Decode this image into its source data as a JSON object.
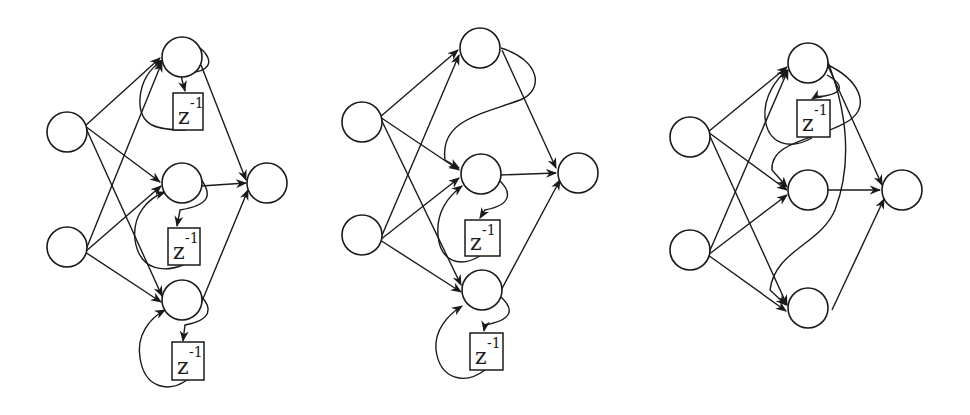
{
  "figure": {
    "node_radius": 20,
    "stroke_color": "#1a1a1a",
    "background": "#ffffff"
  },
  "delay_label": {
    "base": "z",
    "exponent": "-1"
  },
  "diagrams": [
    {
      "id": "diagram-1",
      "nodes": {
        "input1": [
          67,
          132
        ],
        "input2": [
          67,
          247
        ],
        "hidden1": [
          182,
          57
        ],
        "hidden2": [
          182,
          183
        ],
        "hidden3": [
          182,
          300
        ],
        "output": [
          267,
          183
        ]
      },
      "delays": [
        {
          "x": 173,
          "y": 93,
          "w": 30,
          "h": 37
        },
        {
          "x": 168,
          "y": 228,
          "w": 32,
          "h": 37
        },
        {
          "x": 172,
          "y": 342,
          "w": 32,
          "h": 38
        }
      ],
      "edges": [
        "M85,126 L160,58",
        "M85,126 L160,182",
        "M85,126 L162,296",
        "M85,252 L162,62",
        "M85,252 L161,186",
        "M85,252 L161,302",
        "M201,186 L246,183",
        "M201,65 L246,180",
        "M200,306 L248,190"
      ],
      "arrowless": [],
      "loops": [
        {
          "out": "M200,48 C215,60 212,75 180,72 L185,91",
          "back": "M186,130 C160,130 138,128 140,98 C142,75 155,65 163,60"
        },
        {
          "out": "M200,178 C213,195 210,205 180,210 L177,226",
          "back": "M183,265 C165,272 140,272 135,240 C132,215 148,198 165,192"
        },
        {
          "out": "M200,295 C213,308 212,320 185,325 L183,341",
          "back": "M187,380 C170,392 145,390 140,358 C136,335 150,318 165,310"
        }
      ]
    },
    {
      "id": "diagram-2",
      "nodes": {
        "input1": [
          362,
          122
        ],
        "input2": [
          362,
          235
        ],
        "hidden1": [
          480,
          48
        ],
        "hidden2": [
          481,
          174
        ],
        "hidden3": [
          482,
          290
        ],
        "output": [
          578,
          173
        ]
      },
      "delays": [
        {
          "x": 465,
          "y": 220,
          "w": 35,
          "h": 36
        },
        {
          "x": 470,
          "y": 333,
          "w": 33,
          "h": 37
        }
      ],
      "edges": [
        "M380,117 L458,50",
        "M380,117 L459,170",
        "M380,117 L461,285",
        "M380,240 L459,55",
        "M380,240 L459,178",
        "M380,240 L461,292",
        "M500,175 L556,173",
        "M502,50 L556,168",
        "M498,296 L560,180"
      ],
      "loops": [
        {
          "out": "M501,48 C540,60 545,90 520,100 C480,115 440,120 445,160 L459,168",
          "back": null
        },
        {
          "out": "M499,180 C512,192 512,205 485,210 L480,218",
          "back": "M480,256 C460,268 440,262 438,235 C436,210 450,195 462,186"
        },
        {
          "out": "M501,297 C515,310 512,320 485,325 L484,331",
          "back": "M485,370 C465,385 440,380 436,350 C434,330 448,315 462,306"
        }
      ]
    },
    {
      "id": "diagram-3",
      "nodes": {
        "input1": [
          690,
          137
        ],
        "input2": [
          690,
          250
        ],
        "hidden1": [
          808,
          63
        ],
        "hidden2": [
          808,
          190
        ],
        "hidden3": [
          808,
          308
        ],
        "output": [
          902,
          190
        ]
      },
      "delays": [
        {
          "x": 797,
          "y": 100,
          "w": 33,
          "h": 37
        }
      ],
      "edges": [
        "M708,132 L787,67",
        "M708,132 L787,190",
        "M708,132 L787,305",
        "M708,255 L788,70",
        "M708,255 L787,195",
        "M708,255 L786,311",
        "M828,190 L880,190",
        "M828,66 L882,185",
        "M832,310 L884,199"
      ],
      "loops": [
        {
          "out": "M827,75 C845,85 845,95 815,97 L812,99",
          "back": "M812,138 C790,150 768,145 765,118 C763,95 778,78 787,70"
        },
        {
          "out": "M826,64 C860,80 870,105 850,120 C820,140 770,140 772,170 L787,187",
          "back": null
        },
        {
          "out": "M828,62 C850,120 850,170 835,210 C820,245 775,250 770,290 L786,305",
          "back": null
        }
      ]
    }
  ]
}
